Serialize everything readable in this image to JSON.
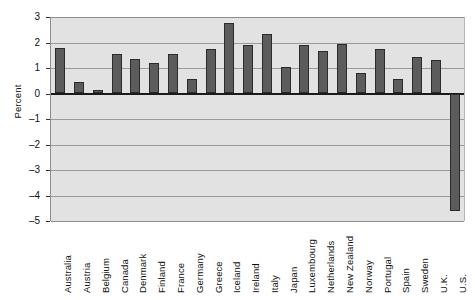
{
  "chart_data": {
    "type": "bar",
    "title": "",
    "xlabel": "",
    "ylabel": "Percent",
    "ylim": [
      -5,
      3
    ],
    "yticks": [
      3,
      2,
      1,
      0,
      -1,
      -2,
      -3,
      -4,
      -5
    ],
    "ytick_labels": [
      "3",
      "2",
      "1",
      "0",
      "–1",
      "–2",
      "–3",
      "–4",
      "–5"
    ],
    "grid": true,
    "legend": "none",
    "categories": [
      "Australia",
      "Austria",
      "Belgium",
      "Canada",
      "Denmark",
      "Finland",
      "France",
      "Germany",
      "Greece",
      "Iceland",
      "Ireland",
      "Italy",
      "Japan",
      "Luxembourg",
      "Netherlands",
      "New Zealand",
      "Norway",
      "Portugal",
      "Spain",
      "Sweden",
      "U.K.",
      "U.S."
    ],
    "values": [
      1.78,
      0.44,
      0.13,
      1.56,
      1.37,
      1.19,
      1.53,
      0.57,
      1.76,
      2.78,
      1.89,
      2.35,
      1.03,
      1.89,
      1.65,
      1.96,
      0.8,
      1.76,
      0.57,
      1.43,
      1.32,
      -4.6
    ],
    "colors": {
      "bar_fill": "#5c5c5c",
      "bar_edge": "#2b2b2b",
      "plot_background": "#e2e2e2",
      "gridline": "#9a9a9a",
      "zero_line": "#1b1b1b",
      "text": "#111111"
    }
  }
}
